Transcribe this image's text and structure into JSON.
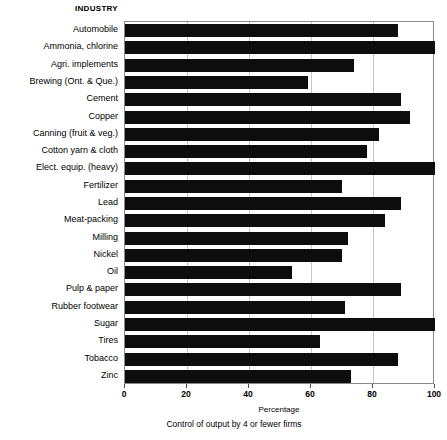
{
  "chart_data": {
    "type": "bar",
    "orientation": "horizontal",
    "title": "",
    "header": "INDUSTRY",
    "xlabel": "Percentage",
    "ylabel": "INDUSTRY",
    "caption": "Control of output by 4 or fewer firms",
    "xlim": [
      0,
      100
    ],
    "xticks": [
      0,
      20,
      40,
      60,
      80,
      100
    ],
    "xtick_labels": [
      "0",
      "20",
      "40",
      "60",
      "80",
      "100"
    ],
    "grid": true,
    "grid_axis": "x",
    "legend": false,
    "bar_color": "#0d0d0d",
    "categories": [
      "Automobile",
      "Ammonia, chlorine",
      "Agri. implements",
      "Brewing (Ont. & Que.)",
      "Cement",
      "Copper",
      "Canning (fruit & veg.)",
      "Cotton yarn & cloth",
      "Elect. equip. (heavy)",
      "Fertilizer",
      "Lead",
      "Meat-packing",
      "Milling",
      "Nickel",
      "Oil",
      "Pulp & paper",
      "Rubber footwear",
      "Sugar",
      "Tires",
      "Tobacco",
      "Zinc"
    ],
    "values": [
      88,
      100,
      74,
      59,
      89,
      92,
      82,
      78,
      100,
      70,
      89,
      84,
      72,
      70,
      54,
      89,
      71,
      100,
      63,
      88,
      73
    ]
  }
}
